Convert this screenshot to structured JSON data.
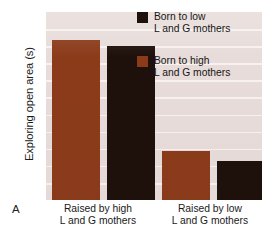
{
  "panel": {
    "letter": "A"
  },
  "chart_data": {
    "type": "bar",
    "title": "",
    "subtitle": "",
    "xlabel": "",
    "ylabel": "Exploring open area (s)",
    "grid": true,
    "gridline_count": 10,
    "legend_position": "top-right",
    "ylim": [
      0,
      100
    ],
    "y_ticks_labeled": false,
    "categories": [
      "Raised by high L and G mothers",
      "Raised by low L and G mothers"
    ],
    "category_labels": [
      [
        "Raised by high",
        "L and G mothers"
      ],
      [
        "Raised by low",
        "L and G mothers"
      ]
    ],
    "series": [
      {
        "name": "Born to high L and G mothers",
        "color": "#8b3b1a",
        "values": [
          85,
          26
        ]
      },
      {
        "name": "Born to low L and G mothers",
        "color": "#1e100a",
        "values": [
          82,
          21
        ]
      }
    ]
  },
  "legend": {
    "entries": [
      {
        "color": "#1e100a",
        "line1": "Born to low",
        "line2": "L and G mothers"
      },
      {
        "color": "#8b3b1a",
        "line1": "Born to high",
        "line2": "L and G mothers"
      }
    ]
  },
  "colors": {
    "plot_background": "#e7dcd9",
    "gridline": "#f7f2f0",
    "page_background": "#ffffff",
    "bar_brown": "#8b3b1a",
    "bar_black": "#1e100a",
    "text": "#1a1a1a"
  }
}
